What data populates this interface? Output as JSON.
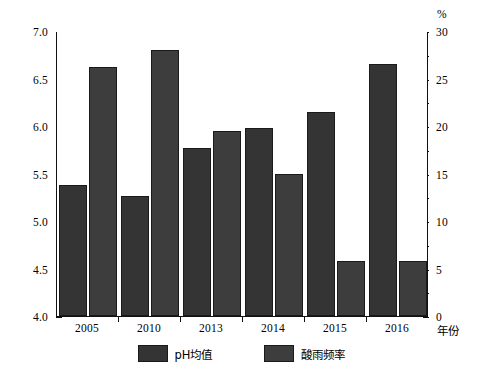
{
  "chart_data": {
    "type": "bar",
    "title": "",
    "xlabel": "年份",
    "ylabel": "",
    "y2label": "%",
    "categories": [
      "2005",
      "2010",
      "2013",
      "2014",
      "2015",
      "2016"
    ],
    "series": [
      {
        "name": "pH均值",
        "axis": "left",
        "values": [
          5.38,
          5.26,
          5.77,
          5.98,
          6.15,
          6.65
        ],
        "color": "#343434"
      },
      {
        "name": "酸雨频率",
        "axis": "right",
        "values": [
          26.2,
          28.0,
          19.5,
          15.0,
          5.8,
          5.8
        ],
        "color": "#3d3d3d"
      }
    ],
    "ylim": [
      4.0,
      7.0
    ],
    "y2lim": [
      0,
      30
    ],
    "yticks": [
      "4.0",
      "4.5",
      "5.0",
      "5.5",
      "6.0",
      "6.5",
      "7.0"
    ],
    "ytick_values": [
      4.0,
      4.5,
      5.0,
      5.5,
      6.0,
      6.5,
      7.0
    ],
    "y_minor_values": [
      4.25,
      4.75,
      5.25,
      5.75,
      6.25,
      6.75
    ],
    "y2ticks": [
      "0",
      "5",
      "10",
      "15",
      "20",
      "25",
      "30"
    ],
    "y2tick_values": [
      0,
      5,
      10,
      15,
      20,
      25,
      30
    ],
    "y2_minor_values": [
      2.5,
      7.5,
      12.5,
      17.5,
      22.5,
      27.5
    ],
    "grid": false,
    "legend_position": "bottom"
  },
  "legend": {
    "entries": [
      {
        "label": "pH均值",
        "color": "#343434"
      },
      {
        "label": "酸雨频率",
        "color": "#3d3d3d"
      }
    ]
  }
}
